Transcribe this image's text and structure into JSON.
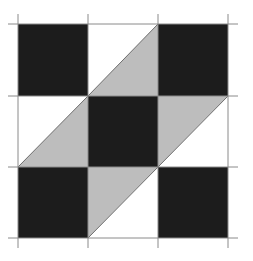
{
  "diagram": {
    "type": "quilt-block",
    "grid": {
      "rows": 3,
      "cols": 3
    },
    "origin": {
      "x": 18,
      "y": 24
    },
    "cell_width": 70,
    "cell_heights": [
      72,
      71,
      71
    ],
    "line_overhang": 10,
    "colors": {
      "dark": "#1c1c1c",
      "light_gray": "#bdbdbd",
      "white": "#ffffff",
      "grid_line": "#8a8a8a",
      "diagonal": "#6e6e6e"
    },
    "cells": [
      {
        "row": 0,
        "col": 0,
        "kind": "solid",
        "fill": "dark"
      },
      {
        "row": 0,
        "col": 1,
        "kind": "half-square",
        "upper_left": "white",
        "lower_right": "light_gray"
      },
      {
        "row": 0,
        "col": 2,
        "kind": "solid",
        "fill": "dark"
      },
      {
        "row": 1,
        "col": 0,
        "kind": "half-square",
        "upper_left": "white",
        "lower_right": "light_gray"
      },
      {
        "row": 1,
        "col": 1,
        "kind": "solid",
        "fill": "dark"
      },
      {
        "row": 1,
        "col": 2,
        "kind": "half-square",
        "upper_left": "light_gray",
        "lower_right": "white"
      },
      {
        "row": 2,
        "col": 0,
        "kind": "solid",
        "fill": "dark"
      },
      {
        "row": 2,
        "col": 1,
        "kind": "half-square",
        "upper_left": "light_gray",
        "lower_right": "white"
      },
      {
        "row": 2,
        "col": 2,
        "kind": "solid",
        "fill": "dark"
      }
    ]
  }
}
